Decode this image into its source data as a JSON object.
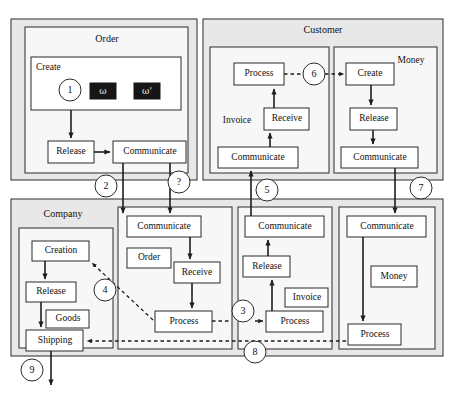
{
  "diagram": {
    "title_hidden": "",
    "pools": [
      {
        "id": "order",
        "label": "Order"
      },
      {
        "id": "customer",
        "label": "Customer"
      },
      {
        "id": "company",
        "label": "Company"
      }
    ],
    "lanes": [
      {
        "id": "order-create",
        "label": "Create"
      },
      {
        "id": "customer-invoice",
        "label": "Invoice"
      },
      {
        "id": "customer-money",
        "label": "Money"
      },
      {
        "id": "company-goods",
        "label": "Goods"
      },
      {
        "id": "company-order",
        "label": "Order"
      },
      {
        "id": "company-invoice",
        "label": "Invoice"
      },
      {
        "id": "company-money",
        "label": "Money"
      }
    ],
    "tokens": [
      {
        "id": "token-omega",
        "label": "ω"
      },
      {
        "id": "token-omega-prime",
        "label": "ω'"
      }
    ],
    "activities": [
      {
        "id": "order-release",
        "label": "Release"
      },
      {
        "id": "order-communicate",
        "label": "Communicate"
      },
      {
        "id": "cust-inv-process",
        "label": "Process"
      },
      {
        "id": "cust-inv-receive",
        "label": "Receive"
      },
      {
        "id": "cust-inv-communicate",
        "label": "Communicate"
      },
      {
        "id": "cust-money-create",
        "label": "Create"
      },
      {
        "id": "cust-money-release",
        "label": "Release"
      },
      {
        "id": "cust-money-communicate",
        "label": "Communicate"
      },
      {
        "id": "comp-goods-creation",
        "label": "Creation"
      },
      {
        "id": "comp-goods-release",
        "label": "Release"
      },
      {
        "id": "comp-goods-shipping",
        "label": "Shipping"
      },
      {
        "id": "comp-order-communicate",
        "label": "Communicate"
      },
      {
        "id": "comp-order-receive",
        "label": "Receive"
      },
      {
        "id": "comp-order-process",
        "label": "Process"
      },
      {
        "id": "comp-inv-communicate",
        "label": "Communicate"
      },
      {
        "id": "comp-inv-release",
        "label": "Release"
      },
      {
        "id": "comp-inv-process",
        "label": "Process"
      },
      {
        "id": "comp-money-communicate",
        "label": "Communicate"
      },
      {
        "id": "comp-money-process",
        "label": "Process"
      }
    ],
    "connectors": [
      {
        "id": "connector-1",
        "label": "1"
      },
      {
        "id": "connector-2",
        "label": "2"
      },
      {
        "id": "connector-question",
        "label": "?"
      },
      {
        "id": "connector-3",
        "label": "3"
      },
      {
        "id": "connector-4",
        "label": "4"
      },
      {
        "id": "connector-5",
        "label": "5"
      },
      {
        "id": "connector-6",
        "label": "6"
      },
      {
        "id": "connector-7",
        "label": "7"
      },
      {
        "id": "connector-8",
        "label": "8"
      },
      {
        "id": "connector-9",
        "label": "9"
      }
    ],
    "colors": {
      "pool_fill": "#e8e8e8",
      "lane_fill": "#f5f5f5",
      "box_fill": "#ffffff",
      "token_fill": "#161616",
      "stroke": "#2b2b2b",
      "page": "#ffffff"
    }
  }
}
